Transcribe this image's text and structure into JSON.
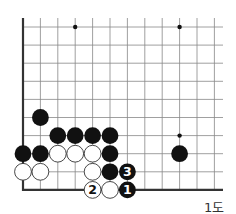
{
  "diagram": {
    "caption": "1도",
    "grid": {
      "origin_x": 23,
      "origin_y": 27,
      "step_x": 17.4,
      "step_y": 18.1,
      "cols": 12,
      "rows": 10,
      "right_extent": 223,
      "top_extent": 18
    },
    "star_points": [
      {
        "col": 3,
        "row": 0
      },
      {
        "col": 9,
        "row": 0
      },
      {
        "col": 9,
        "row": 6
      }
    ],
    "stones": [
      {
        "color": "black",
        "col": 1,
        "row": 5,
        "label": ""
      },
      {
        "color": "black",
        "col": 2,
        "row": 6,
        "label": ""
      },
      {
        "color": "black",
        "col": 3,
        "row": 6,
        "label": ""
      },
      {
        "color": "black",
        "col": 4,
        "row": 6,
        "label": ""
      },
      {
        "color": "black",
        "col": 5,
        "row": 6,
        "label": ""
      },
      {
        "color": "black",
        "col": 0,
        "row": 7,
        "label": ""
      },
      {
        "color": "black",
        "col": 1,
        "row": 7,
        "label": ""
      },
      {
        "color": "white",
        "col": 2,
        "row": 7,
        "label": ""
      },
      {
        "color": "white",
        "col": 3,
        "row": 7,
        "label": ""
      },
      {
        "color": "white",
        "col": 4,
        "row": 7,
        "label": ""
      },
      {
        "color": "black",
        "col": 5,
        "row": 7,
        "label": ""
      },
      {
        "color": "black",
        "col": 9,
        "row": 7,
        "label": ""
      },
      {
        "color": "white",
        "col": 0,
        "row": 8,
        "label": ""
      },
      {
        "color": "white",
        "col": 1,
        "row": 8,
        "label": ""
      },
      {
        "color": "white",
        "col": 4,
        "row": 8,
        "label": ""
      },
      {
        "color": "black",
        "col": 5,
        "row": 8,
        "label": ""
      },
      {
        "color": "black",
        "col": 6,
        "row": 8,
        "label": "3"
      },
      {
        "color": "white",
        "col": 4,
        "row": 9,
        "label": "2"
      },
      {
        "color": "white",
        "col": 5,
        "row": 9,
        "label": ""
      },
      {
        "color": "black",
        "col": 6,
        "row": 9,
        "label": "1"
      }
    ],
    "colors": {
      "line": "#888888",
      "edge": "#333333",
      "black_stone": "#111111",
      "white_stone": "#ffffff",
      "stone_outline": "#333333"
    }
  }
}
